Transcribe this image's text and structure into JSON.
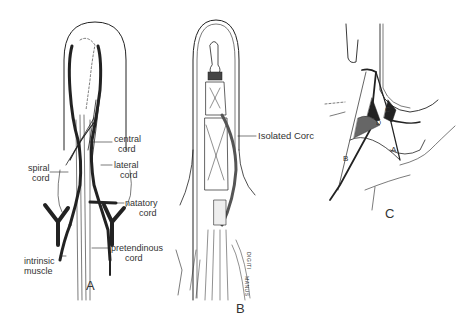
{
  "figure": {
    "panels": [
      {
        "id": "A",
        "letter": "A",
        "labels": {
          "central_cord_1": "central",
          "central_cord_2": "cord",
          "lateral_cord_1": "lateral",
          "lateral_cord_2": "cord",
          "spiral_cord_1": "spiral",
          "spiral_cord_2": "cord",
          "natatory_cord_1": "natatory",
          "natatory_cord_2": "cord",
          "pretendinous_cord_1": "pretendinous",
          "pretendinous_cord_2": "cord",
          "intrinsic_muscle_1": "intrinsic",
          "intrinsic_muscle_2": "muscle"
        }
      },
      {
        "id": "B",
        "letter": "B",
        "labels": {
          "isolated_cord": "Isolated Corc",
          "vertical_text_1": "MANUS",
          "vertical_text_2": "DIGITI"
        }
      },
      {
        "id": "C",
        "letter": "C",
        "labels": {
          "a": "A",
          "b": "B",
          "c": "C",
          "d": "D"
        }
      }
    ]
  }
}
